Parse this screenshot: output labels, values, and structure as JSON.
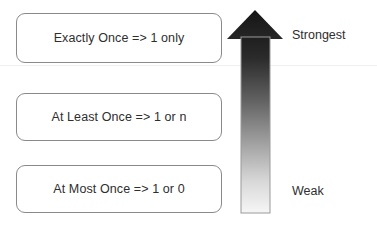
{
  "diagram": {
    "boxes": [
      {
        "id": "exactly-once",
        "label": "Exactly Once => 1 only"
      },
      {
        "id": "at-least-once",
        "label": "At Least Once => 1 or n"
      },
      {
        "id": "at-most-once",
        "label": "At Most Once => 1 or 0"
      }
    ],
    "scale": {
      "top_label": "Strongest",
      "bottom_label": "Weak",
      "arrow_direction": "up",
      "arrow_gradient_top_color": "#1a1a1a",
      "arrow_gradient_bottom_color": "#f4f4f4",
      "arrow_outline_color": "#9a9a9a"
    },
    "colors": {
      "background": "#ffffff",
      "box_border": "#8a8a8a",
      "text": "#2e2e2e"
    }
  }
}
